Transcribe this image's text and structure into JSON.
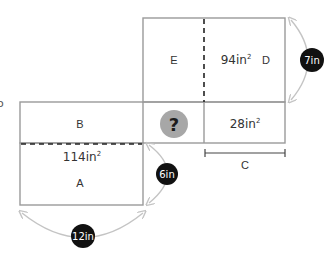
{
  "diagram": {
    "type": "composite-rectangle-area-puzzle",
    "colors": {
      "outline": "#9a9a9a",
      "dashed": "#222222",
      "arc": "#c4c4c4",
      "badge_fill": "#111111",
      "badge_text": "#ffffff",
      "question_fill": "#a7a7a7",
      "question_text": "#1c1c1c",
      "label_text": "#333333"
    },
    "regions": [
      {
        "id": "E",
        "label": "E"
      },
      {
        "id": "D",
        "label": "D",
        "area": "94in",
        "exp": "2"
      },
      {
        "id": "B",
        "label": "B"
      },
      {
        "id": "A",
        "label": "A",
        "area": "114in",
        "exp": "2"
      },
      {
        "id": "C",
        "label": "C",
        "area": "28in",
        "exp": "2"
      },
      {
        "id": "unknown",
        "label": "?"
      }
    ],
    "dimensions": [
      {
        "id": "height-D",
        "value": "7in"
      },
      {
        "id": "height-A",
        "value": "6in"
      },
      {
        "id": "width-A",
        "value": "12in"
      },
      {
        "id": "width-C",
        "label": "C"
      }
    ],
    "edge_glyph": "o"
  }
}
